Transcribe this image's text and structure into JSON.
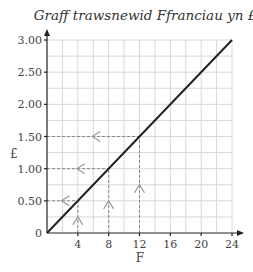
{
  "chart_data": {
    "type": "line",
    "title": "Graff trawsnewid Ffranciau yn £",
    "xlabel": "F",
    "ylabel": "£",
    "x": [
      0,
      24
    ],
    "series": [
      {
        "name": "conversion",
        "x": [
          0,
          24
        ],
        "y": [
          0,
          3.0
        ]
      }
    ],
    "xlim": [
      0,
      24
    ],
    "ylim": [
      0,
      3.0
    ],
    "x_ticks": [
      4,
      8,
      12,
      16,
      20,
      24
    ],
    "x_tick_labels": [
      "4",
      "8",
      "12",
      "16",
      "20",
      "24"
    ],
    "y_ticks": [
      0,
      0.5,
      1.0,
      1.5,
      2.0,
      2.5,
      3.0
    ],
    "y_tick_labels": [
      "0",
      "0.50",
      "1.00",
      "1.50",
      "2.00",
      "2.50",
      "3.00"
    ],
    "origin_label": "0",
    "grid": true,
    "grid_minor_x_step": 2,
    "grid_minor_y_step": 0.25,
    "annotations": [
      {
        "type": "dashed-guide",
        "from_x": 4,
        "to_y": 0.5,
        "arrows": [
          "up",
          "left"
        ]
      },
      {
        "type": "dashed-guide",
        "from_x": 8,
        "to_y": 1.0,
        "arrows": [
          "up",
          "left"
        ]
      },
      {
        "type": "dashed-guide",
        "from_x": 12,
        "to_y": 1.5,
        "arrows": [
          "up",
          "left"
        ]
      }
    ],
    "legend": null
  },
  "colors": {
    "line": "#222222",
    "grid": "#d8d8d8",
    "guide": "#888888",
    "arrow": "#999999"
  }
}
